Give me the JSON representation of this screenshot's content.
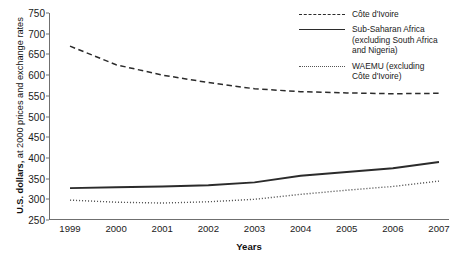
{
  "chart_data": {
    "type": "line",
    "title": "",
    "xlabel": "Years",
    "ylabel_bold": "U.S. dollars,",
    "ylabel_rest": " at 2000 prices and exchange rates",
    "x": [
      1999,
      2000,
      2001,
      2002,
      2003,
      2004,
      2005,
      2006,
      2007
    ],
    "categories": [
      "1999",
      "2000",
      "2001",
      "2002",
      "2003",
      "2004",
      "2005",
      "2006",
      "2007"
    ],
    "ylim": [
      250,
      750
    ],
    "yticks": [
      250,
      300,
      350,
      400,
      450,
      500,
      550,
      600,
      650,
      700,
      750
    ],
    "ytick_labels": [
      "250",
      "300",
      "350",
      "400",
      "450",
      "500",
      "550",
      "600",
      "650",
      "700",
      "750"
    ],
    "grid": false,
    "legend_position": "top-right",
    "series": [
      {
        "name": "Côte d'Ivoire",
        "style": "dashed",
        "color": "#2b2b2b",
        "values": [
          670,
          625,
          600,
          582,
          567,
          560,
          557,
          555,
          556
        ]
      },
      {
        "name": "Sub-Saharan Africa (excluding South Africa and Nigeria)",
        "style": "solid",
        "color": "#2b2b2b",
        "values": [
          327,
          329,
          331,
          334,
          341,
          357,
          366,
          375,
          390
        ]
      },
      {
        "name": "WAEMU (excluding Côte d'Ivoire)",
        "style": "dotted",
        "color": "#555555",
        "values": [
          298,
          293,
          291,
          294,
          300,
          312,
          322,
          331,
          344
        ]
      }
    ]
  },
  "legend": {
    "items": [
      {
        "key": "dashed",
        "lines": [
          "Côte d'Ivoire"
        ]
      },
      {
        "key": "solid",
        "lines": [
          "Sub-Saharan Africa",
          "(excluding South Africa",
          "and Nigeria)"
        ]
      },
      {
        "key": "dotted",
        "lines": [
          "WAEMU (excluding",
          "Côte d'Ivoire)"
        ]
      }
    ]
  }
}
